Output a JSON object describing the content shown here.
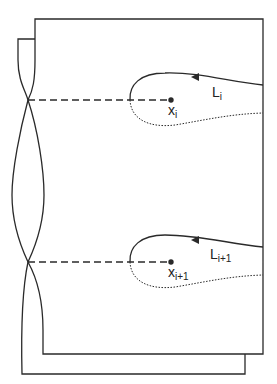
{
  "diagram": {
    "labels": {
      "L_i": {
        "base": "L",
        "sub": "i"
      },
      "x_i": {
        "base": "x",
        "sub": "i"
      },
      "L_i1": {
        "base": "L",
        "sub": "i+1"
      },
      "x_i1": {
        "base": "x",
        "sub": "i+1"
      }
    },
    "colors": {
      "stroke": "#2a2a2a",
      "background": "#ffffff"
    }
  }
}
